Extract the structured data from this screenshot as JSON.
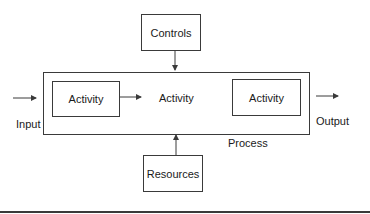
{
  "diagram": {
    "type": "process-flow",
    "controls": {
      "label": "Controls"
    },
    "resources": {
      "label": "Resources"
    },
    "process": {
      "label": "Process",
      "activities": [
        {
          "label": "Activity",
          "boxed": true
        },
        {
          "label": "Activity",
          "boxed": false
        },
        {
          "label": "Activity",
          "boxed": true
        }
      ]
    },
    "input": {
      "label": "Input"
    },
    "output": {
      "label": "Output"
    },
    "edges": [
      {
        "from": "Input",
        "to": "Process"
      },
      {
        "from": "Controls",
        "to": "Process"
      },
      {
        "from": "Resources",
        "to": "Process"
      },
      {
        "from": "Activity 1",
        "to": "Activity 2"
      },
      {
        "from": "Process",
        "to": "Output"
      }
    ],
    "colors": {
      "stroke": "#3a3a3a",
      "text": "#1a1a1a",
      "background": "#ffffff"
    }
  }
}
